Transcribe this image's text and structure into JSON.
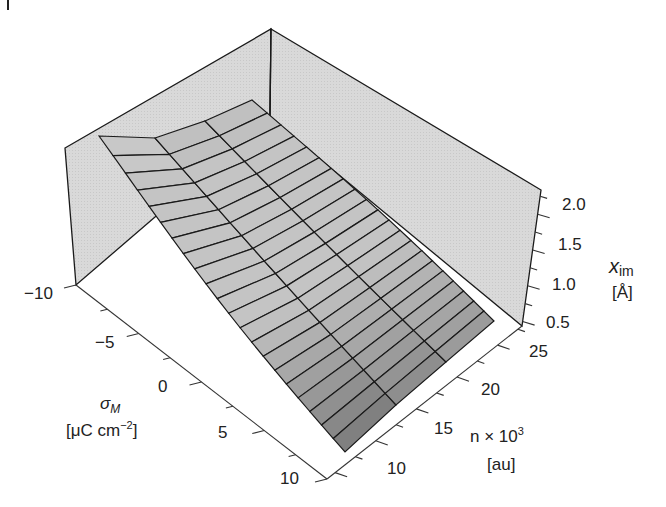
{
  "chart_data": {
    "type": "surface3d",
    "title": "",
    "axes": {
      "x": {
        "label": "σ_M",
        "unit": "[μC cm^-2]",
        "ticks": [
          -10,
          -5,
          0,
          5,
          10
        ],
        "range": [
          -10,
          10
        ]
      },
      "y": {
        "label": "n × 10^3",
        "unit": "[au]",
        "ticks": [
          10,
          15,
          20,
          25
        ],
        "range": [
          8,
          28
        ]
      },
      "z": {
        "label": "x_im",
        "unit": "[Å]",
        "ticks": [
          0.5,
          1.0,
          1.5,
          2.0
        ],
        "range": [
          0.4,
          2.2
        ]
      }
    },
    "sample_surface": {
      "sigma": [
        -10,
        -5,
        0,
        5,
        10
      ],
      "n": [
        10,
        15,
        20,
        25
      ],
      "x_im_approx": [
        [
          1.9,
          1.8,
          1.7,
          1.6
        ],
        [
          1.6,
          1.5,
          1.4,
          1.3
        ],
        [
          1.3,
          1.2,
          1.1,
          1.0
        ],
        [
          1.0,
          0.9,
          0.8,
          0.75
        ],
        [
          0.75,
          0.7,
          0.65,
          0.6
        ]
      ]
    },
    "grid": false,
    "legend": null
  },
  "labels": {
    "sigma_symbol": "σ",
    "sigma_sub": "M",
    "sigma_unit_pre": "[μC cm",
    "sigma_unit_sup": "−2",
    "sigma_unit_post": "]",
    "n_label_pre": "n × 10",
    "n_label_sup": "3",
    "n_unit": "[au]",
    "z_symbol": "x",
    "z_sub": "im",
    "z_unit": "[Å]"
  },
  "ticks": {
    "sigma": [
      "−10",
      "−5",
      "0",
      "5",
      "10"
    ],
    "n": [
      "10",
      "15",
      "20",
      "25"
    ],
    "z": [
      "0.5",
      "1.0",
      "1.5",
      "2.0"
    ]
  },
  "colors": {
    "wall": "#d6d6d6",
    "line": "#1a1a1a",
    "surface_light": "#c4c4c4",
    "surface_dark": "#7e7e7e"
  }
}
